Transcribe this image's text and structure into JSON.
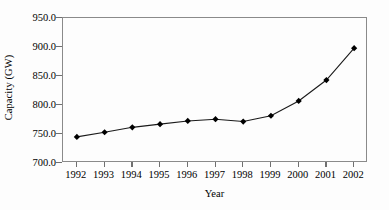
{
  "chart_data": {
    "type": "line",
    "title": "",
    "xlabel": "Year",
    "ylabel": "Capacity (GW)",
    "categories": [
      "1992",
      "1993",
      "1994",
      "1995",
      "1996",
      "1997",
      "1998",
      "1999",
      "2000",
      "2001",
      "2002"
    ],
    "x": [
      1992,
      1993,
      1994,
      1995,
      1996,
      1997,
      1998,
      1999,
      2000,
      2001,
      2002
    ],
    "values": [
      745.0,
      753.0,
      761.5,
      767.0,
      772.5,
      775.5,
      771.5,
      781.5,
      807.0,
      843.0,
      898.0
    ],
    "series": [
      {
        "name": "Capacity",
        "values": [
          745.0,
          753.0,
          761.5,
          767.0,
          772.5,
          775.5,
          771.5,
          781.5,
          807.0,
          843.0,
          898.0
        ]
      }
    ],
    "ylim": [
      700.0,
      950.0
    ],
    "ytick_values": [
      700.0,
      750.0,
      800.0,
      850.0,
      900.0,
      950.0
    ],
    "ytick_labels": [
      "700.0",
      "750.0",
      "800.0",
      "850.0",
      "900.0",
      "950.0"
    ],
    "xtick_labels": [
      "1992",
      "1993",
      "1994",
      "1995",
      "1996",
      "1997",
      "1998",
      "1999",
      "2000",
      "2001",
      "2002"
    ],
    "grid": false,
    "legend": "none",
    "marker": "diamond",
    "line_color": "#1a1a1a",
    "marker_color": "#000000",
    "frame_color": "#8a8a8a",
    "background": "#ffffff"
  },
  "axes": {
    "y_title": "Capacity (GW)",
    "x_title": "Year"
  }
}
